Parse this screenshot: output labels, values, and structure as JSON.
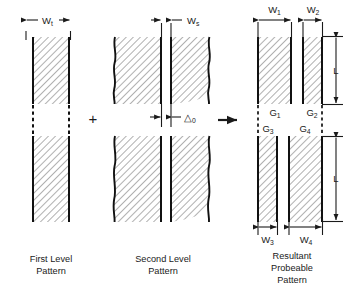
{
  "figure": {
    "operators": {
      "plus": "+",
      "arrow": "→"
    },
    "colors": {
      "ink": "#1a1a1a",
      "edge": "#111111",
      "hatch": "#6e6e6e",
      "fill": "#ffffff",
      "background": "#ffffff"
    }
  },
  "panels": [
    {
      "id": "first-level",
      "caption_lines": [
        "First Level",
        "Pattern"
      ],
      "dimensions": [
        {
          "id": "wt",
          "base": "W",
          "subscript": "t"
        }
      ]
    },
    {
      "id": "second-level",
      "caption_lines": [
        "Second Level",
        "Pattern"
      ],
      "dimensions": [
        {
          "id": "ws",
          "base": "W",
          "subscript": "s"
        },
        {
          "id": "delta0",
          "base": "△",
          "subscript": "0"
        }
      ]
    },
    {
      "id": "resultant",
      "caption_lines": [
        "Resultant",
        "Probeable",
        "Pattern"
      ],
      "dimensions": [
        {
          "id": "w1",
          "base": "W",
          "subscript": "1"
        },
        {
          "id": "w2",
          "base": "W",
          "subscript": "2"
        },
        {
          "id": "w3",
          "base": "W",
          "subscript": "3"
        },
        {
          "id": "w4",
          "base": "W",
          "subscript": "4"
        },
        {
          "id": "l-upper",
          "base": "L",
          "subscript": ""
        },
        {
          "id": "l-lower",
          "base": "L",
          "subscript": ""
        }
      ],
      "gap_labels": [
        {
          "id": "g1",
          "base": "G",
          "subscript": "1"
        },
        {
          "id": "g2",
          "base": "G",
          "subscript": "2"
        },
        {
          "id": "g3",
          "base": "G",
          "subscript": "3"
        },
        {
          "id": "g4",
          "base": "G",
          "subscript": "4"
        }
      ]
    }
  ]
}
